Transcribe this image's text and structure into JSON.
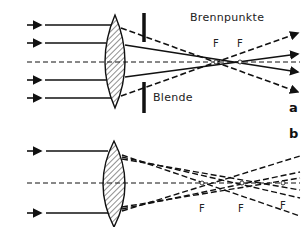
{
  "panel_a": {
    "label": "a",
    "title_label": "Brennpunkte",
    "aperture_label": "Blende",
    "focal_labels": [
      "F",
      "F"
    ]
  },
  "panel_b": {
    "label": "b",
    "focal_labels": [
      "F",
      "F",
      "F"
    ]
  },
  "icons": {
    "lens": "biconvex-lens-hatched",
    "aperture": "aperture-stop-bars",
    "ray_arrow": "arrow-right"
  }
}
